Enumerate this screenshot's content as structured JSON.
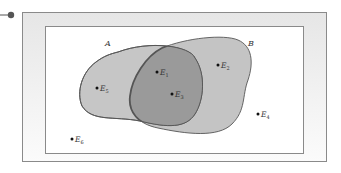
{
  "diagram": {
    "type": "venn",
    "sets": [
      {
        "id": "A",
        "label": "A",
        "fill": "#c4c4c4"
      },
      {
        "id": "B",
        "label": "B",
        "fill": "#c4c4c4"
      }
    ],
    "intersection_fill": "#9a9a9a",
    "stroke_color": "#555555",
    "frame": {
      "outer_fill": "#eeeeee",
      "inner_fill": "#ffffff",
      "border_color": "#8a8a8a"
    },
    "connector_color": "#555555",
    "points": [
      {
        "id": "E1",
        "base": "E",
        "sub": "1",
        "region": "A∩B"
      },
      {
        "id": "E2",
        "base": "E",
        "sub": "2",
        "region": "B only"
      },
      {
        "id": "E3",
        "base": "E",
        "sub": "3",
        "region": "A∩B"
      },
      {
        "id": "E4",
        "base": "E",
        "sub": "4",
        "region": "outside"
      },
      {
        "id": "E5",
        "base": "E",
        "sub": "5",
        "region": "A only"
      },
      {
        "id": "E6",
        "base": "E",
        "sub": "6",
        "region": "outside"
      }
    ]
  }
}
